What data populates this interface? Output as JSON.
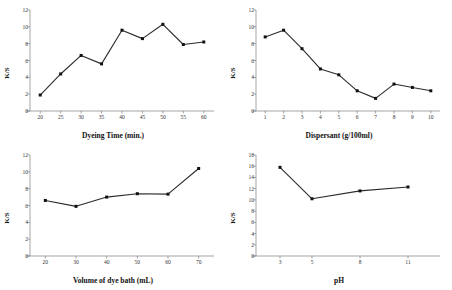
{
  "figure": {
    "background": "#ffffff",
    "line_color": "#2b2b2b",
    "marker_color": "#111111",
    "axis_color": "#808080"
  },
  "chart_data": [
    {
      "id": "dyeing-time",
      "type": "line",
      "title": "",
      "xlabel": "Dyeing Time (min.)",
      "ylabel": "K/S",
      "x": [
        20,
        25,
        30,
        35,
        40,
        45,
        50,
        55,
        60
      ],
      "values": [
        1.9,
        4.4,
        6.6,
        5.6,
        9.6,
        8.6,
        10.3,
        7.9,
        8.2
      ],
      "xticks": [
        "20",
        "25",
        "30",
        "35",
        "40",
        "45",
        "50",
        "55",
        "60"
      ],
      "yticks": [
        "0",
        "2",
        "4",
        "6",
        "8",
        "10",
        "12"
      ],
      "xlim": [
        17.5,
        62.5
      ],
      "ylim": [
        0,
        12
      ],
      "grid": false,
      "legend": "none"
    },
    {
      "id": "dispersant",
      "type": "line",
      "title": "",
      "xlabel": "Dispersant (g/100ml)",
      "ylabel": "K/S",
      "x": [
        1,
        2,
        3,
        4,
        5,
        6,
        7,
        8,
        9,
        10
      ],
      "values": [
        8.8,
        9.6,
        7.4,
        5.0,
        4.3,
        2.4,
        1.5,
        3.2,
        2.8,
        2.4
      ],
      "xticks": [
        "1",
        "2",
        "3",
        "4",
        "5",
        "6",
        "7",
        "8",
        "9",
        "10"
      ],
      "yticks": [
        "0",
        "2",
        "4",
        "6",
        "8",
        "10",
        "12"
      ],
      "xlim": [
        0.5,
        10.5
      ],
      "ylim": [
        0,
        12
      ],
      "grid": false,
      "legend": "none"
    },
    {
      "id": "volume-of-dye-bath",
      "type": "line",
      "title": "",
      "xlabel": "Volume of dye bath (mL)",
      "ylabel": "K/S",
      "x": [
        20,
        30,
        40,
        50,
        60,
        70
      ],
      "values": [
        6.6,
        5.9,
        7.0,
        7.4,
        7.35,
        10.4
      ],
      "xticks": [
        "20",
        "30",
        "40",
        "50",
        "60",
        "70"
      ],
      "yticks": [
        "0",
        "2",
        "4",
        "6",
        "8",
        "10",
        "12"
      ],
      "xlim": [
        15,
        75
      ],
      "ylim": [
        0,
        12
      ],
      "grid": false,
      "legend": "none"
    },
    {
      "id": "ph",
      "type": "line",
      "title": "",
      "xlabel": "pH",
      "ylabel": "K/S",
      "x": [
        3,
        5,
        8,
        11
      ],
      "values": [
        15.8,
        10.2,
        11.6,
        12.3
      ],
      "xticks": [
        "3",
        "5",
        "8",
        "11"
      ],
      "yticks": [
        "0",
        "2",
        "4",
        "6",
        "8",
        "10",
        "12",
        "14",
        "16",
        "18"
      ],
      "xlim": [
        1.5,
        13
      ],
      "ylim": [
        0,
        18
      ],
      "grid": false,
      "legend": "none"
    }
  ]
}
